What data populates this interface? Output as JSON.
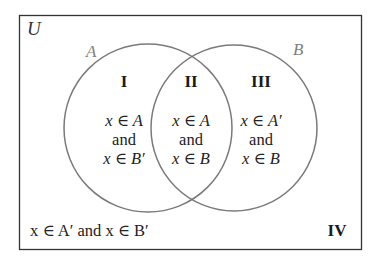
{
  "diagram": {
    "type": "venn",
    "universe_label": "U",
    "sets": [
      {
        "label": "A",
        "color": "#808080"
      },
      {
        "label": "B",
        "color": "#808080"
      }
    ],
    "regions": [
      {
        "id": "I",
        "numeral": "I",
        "line1": "x ∈ A",
        "line2": "and",
        "line3": "x ∈ B′"
      },
      {
        "id": "II",
        "numeral": "II",
        "line1": "x ∈ A",
        "line2": "and",
        "line3": "x ∈ B"
      },
      {
        "id": "III",
        "numeral": "III",
        "line1": "x ∈ A′",
        "line2": "and",
        "line3": "x ∈ B"
      },
      {
        "id": "IV",
        "numeral": "IV",
        "text": "x ∈ A′ and x ∈ B′"
      }
    ],
    "colors": {
      "border": "#333333",
      "circle_stroke": "#7a7a7a",
      "text": "#222222"
    }
  }
}
